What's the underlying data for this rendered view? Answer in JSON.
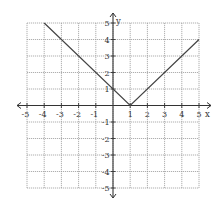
{
  "chart_data": {
    "type": "line",
    "title": "",
    "xlabel": "x",
    "ylabel": "y",
    "xlim": [
      -5,
      5
    ],
    "ylim": [
      -5,
      5
    ],
    "grid": true,
    "x_ticks": [
      -5,
      -4,
      -3,
      -2,
      -1,
      1,
      2,
      3,
      4,
      5
    ],
    "y_ticks": [
      -5,
      -4,
      -3,
      -2,
      -1,
      1,
      2,
      3,
      4,
      5
    ],
    "x_tick_labels": [
      "-5",
      "-4",
      "-3",
      "-2",
      "-1",
      "1",
      "2",
      "3",
      "4",
      "5"
    ],
    "y_tick_labels": [
      "-5",
      "-4",
      "-3",
      "-2",
      "-1",
      "1",
      "2",
      "3",
      "4",
      "5"
    ],
    "series": [
      {
        "name": "y = |x - 1|",
        "x": [
          -4,
          1,
          5
        ],
        "y": [
          5,
          0,
          4
        ]
      }
    ]
  },
  "colors": {
    "grid": "#9a9a9a",
    "axis": "#333333",
    "line": "#444444"
  }
}
